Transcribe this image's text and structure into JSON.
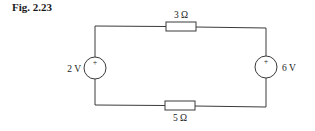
{
  "figure": {
    "label": "Fig. 2.23"
  },
  "circuit": {
    "sources": [
      {
        "id": "left-source",
        "label": "2 V",
        "polarity": "+"
      },
      {
        "id": "right-source",
        "label": "6 V",
        "polarity": "+"
      }
    ],
    "resistors": [
      {
        "id": "top-resistor",
        "label": "3 Ω"
      },
      {
        "id": "bottom-resistor",
        "label": "5 Ω"
      }
    ]
  },
  "colors": {
    "wire": "#3a3a3a",
    "text": "#222222",
    "background": "#ffffff"
  }
}
